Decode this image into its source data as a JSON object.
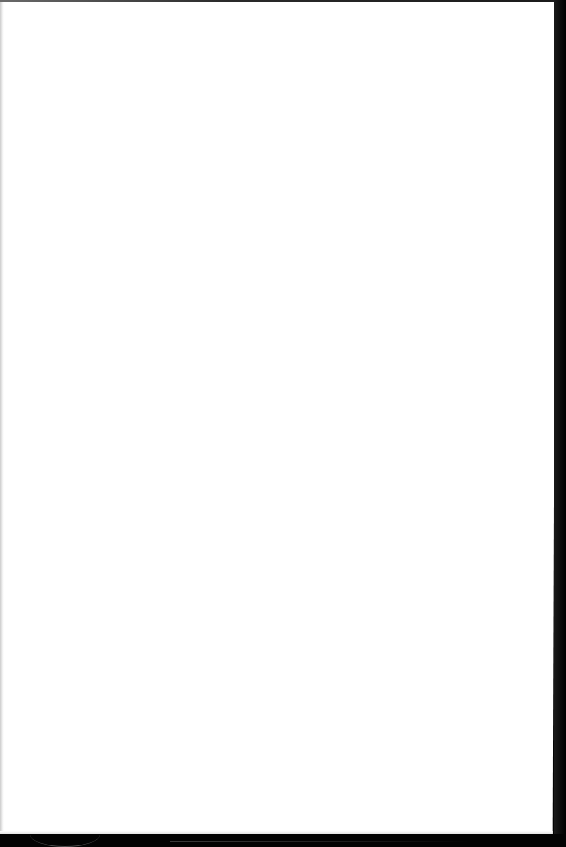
{
  "document": {
    "type": "blank-page",
    "content": "",
    "colors": {
      "page": "#ffffff",
      "background": "#000000",
      "edge_shadow": "#bdbdbd"
    }
  }
}
